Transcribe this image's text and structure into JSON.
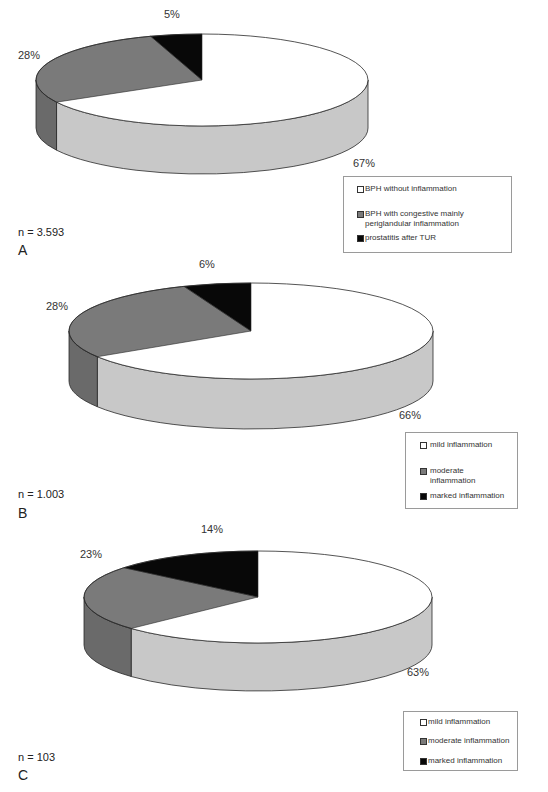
{
  "colors": {
    "top_white": "#ffffff",
    "side_white": "#c8c8c8",
    "top_gray": "#7a7a7a",
    "side_gray": "#6a6a6a",
    "top_black": "#080808",
    "side_black": "#050505",
    "outline": "#2a2a2a"
  },
  "chart_data": [
    {
      "type": "pie",
      "style": "3d",
      "panel": "A",
      "sample_size_label": "n = 3.593",
      "categories": [
        "BPH without inflammation",
        "BPH with congestive mainly periglandular inflammation",
        "prostatitis after TUR"
      ],
      "values": [
        67,
        28,
        5
      ],
      "labels": [
        "67%",
        "28%",
        "5%"
      ],
      "legend_position": "bottom-right"
    },
    {
      "type": "pie",
      "style": "3d",
      "panel": "B",
      "sample_size_label": "n = 1.003",
      "categories": [
        "mild inflammation",
        "moderate inflammation",
        "marked inflammation"
      ],
      "values": [
        66,
        28,
        6
      ],
      "labels": [
        "66%",
        "28%",
        "6%"
      ],
      "legend_position": "bottom-right"
    },
    {
      "type": "pie",
      "style": "3d",
      "panel": "C",
      "sample_size_label": "n = 103",
      "categories": [
        "mild inflammation",
        "moderate inflammation",
        "marked inflammation"
      ],
      "values": [
        63,
        23,
        14
      ],
      "labels": [
        "63%",
        "23%",
        "14%"
      ],
      "legend_position": "bottom-right"
    }
  ],
  "panels": {
    "a": {
      "letter": "A",
      "n": "n = 3.593",
      "pcts": {
        "white": "67%",
        "gray": "28%",
        "black": "5%"
      },
      "legend": [
        "BPH without inflammation",
        "BPH with congestive mainly periglandular inflammation",
        "prostatitis after TUR"
      ]
    },
    "b": {
      "letter": "B",
      "n": "n = 1.003",
      "pcts": {
        "white": "66%",
        "gray": "28%",
        "black": "6%"
      },
      "legend": [
        "mild inflammation",
        "moderate inflammation",
        "marked inflammation"
      ]
    },
    "c": {
      "letter": "C",
      "n": "n = 103",
      "pcts": {
        "white": "63%",
        "gray": "23%",
        "black": "14%"
      },
      "legend": [
        "mild inflammation",
        "moderate inflammation",
        "marked inflammation"
      ]
    }
  }
}
